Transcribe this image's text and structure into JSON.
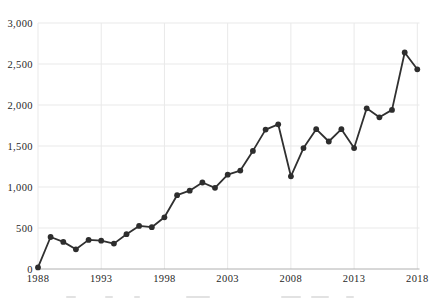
{
  "chart_data": {
    "type": "line",
    "title": "",
    "xlabel": "",
    "ylabel": "",
    "x": [
      1988,
      1989,
      1990,
      1991,
      1992,
      1993,
      1994,
      1995,
      1996,
      1997,
      1998,
      1999,
      2000,
      2001,
      2002,
      2003,
      2004,
      2005,
      2006,
      2007,
      2008,
      2009,
      2010,
      2011,
      2012,
      2013,
      2014,
      2015,
      2016,
      2017,
      2018
    ],
    "series": [
      {
        "name": "annual-count",
        "values": [
          20,
          390,
          330,
          240,
          355,
          345,
          310,
          425,
          525,
          510,
          630,
          900,
          955,
          1055,
          990,
          1150,
          1200,
          1440,
          1700,
          1765,
          1130,
          1475,
          1705,
          1555,
          1705,
          1475,
          1960,
          1850,
          1940,
          2640,
          2435
        ]
      }
    ],
    "xlim": [
      1988,
      2018
    ],
    "ylim": [
      0,
      3000
    ],
    "xticks": [
      1988,
      1993,
      1998,
      2003,
      2008,
      2013,
      2018
    ],
    "xtick_labels": [
      "1988",
      "1993",
      "1998",
      "2003",
      "2008",
      "2013",
      "2018"
    ],
    "yticks": [
      0,
      500,
      1000,
      1500,
      2000,
      2500,
      3000
    ],
    "ytick_labels": [
      "0",
      "500",
      "1,000",
      "1,500",
      "2,000",
      "2,500",
      "3,000"
    ],
    "grid": true,
    "legend": false,
    "marker": "circle",
    "colors": {
      "line": "#303030",
      "marker": "#2d2d2d",
      "gridline": "#e9e9e9",
      "zero_axis": "#b0b0b0",
      "tick_label": "#1f1f1f",
      "background": "#ffffff"
    }
  }
}
